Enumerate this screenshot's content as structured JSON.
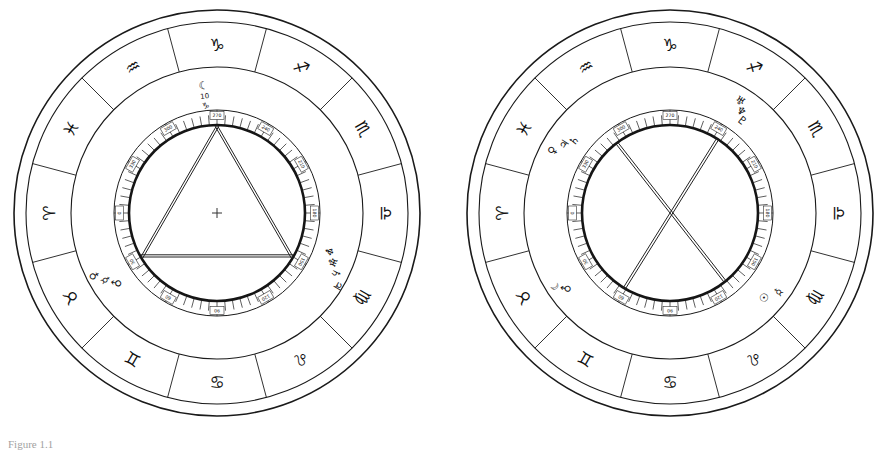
{
  "figure": {
    "caption_label": "Figure",
    "caption_text": "Figure 1.1",
    "background": "#ffffff",
    "ink": "#1a1a1a"
  },
  "zodiac": {
    "order_ccw_from_top": [
      {
        "name": "Capricorn",
        "glyph": "♑",
        "abbr": "Cp"
      },
      {
        "name": "Aquarius",
        "glyph": "♒",
        "abbr": "Aq"
      },
      {
        "name": "Pisces",
        "glyph": "♓",
        "abbr": "Pi"
      },
      {
        "name": "Aries",
        "glyph": "♈",
        "abbr": "Ar"
      },
      {
        "name": "Taurus",
        "glyph": "♉",
        "abbr": "Ta"
      },
      {
        "name": "Gemini",
        "glyph": "♊",
        "abbr": "Ge"
      },
      {
        "name": "Cancer",
        "glyph": "♋",
        "abbr": "Cn"
      },
      {
        "name": "Leo",
        "glyph": "♌",
        "abbr": "Le"
      },
      {
        "name": "Virgo",
        "glyph": "♍",
        "abbr": "Vi"
      },
      {
        "name": "Libra",
        "glyph": "♎",
        "abbr": "Li"
      },
      {
        "name": "Scorpio",
        "glyph": "♏",
        "abbr": "Sc"
      },
      {
        "name": "Sagittarius",
        "glyph": "♐",
        "abbr": "Sg"
      }
    ]
  },
  "chart_data": {
    "type": "diagram",
    "wheels": [
      {
        "id": "left-wheel",
        "label": "Left chart — grand trine",
        "center": {
          "x": 217,
          "y": 213
        },
        "radii": {
          "outer": 203,
          "outer_inner": 191,
          "zodiac_inner": 146,
          "house_outer": 103,
          "house_inner": 88
        },
        "aspect_figure": "triangle",
        "aspect_points_deg": [
          90,
          210,
          330
        ],
        "aspect_name": "grand trine",
        "house_numbers": [
          "270",
          "300",
          "330",
          "0",
          "30",
          "60",
          "90",
          "120",
          "150",
          "180",
          "210",
          "240"
        ],
        "planets": [
          {
            "glyph": "☾",
            "name": "Moon",
            "deg_label": "10",
            "sign_glyph": "♑",
            "angle": 96,
            "radius": 128
          },
          {
            "glyph": "♆",
            "name": "Neptune",
            "angle": 341,
            "radius": 118
          },
          {
            "glyph": "♅",
            "name": "Uranus",
            "angle": 337,
            "radius": 125
          },
          {
            "glyph": "♄",
            "name": "Saturn",
            "angle": 333,
            "radius": 133
          },
          {
            "glyph": "♃",
            "name": "Jupiter",
            "angle": 329,
            "radius": 141
          },
          {
            "glyph": "♂",
            "name": "Mars",
            "angle": 215,
            "radius": 122
          },
          {
            "glyph": "☿",
            "name": "Mercury",
            "angle": 211,
            "radius": 130
          },
          {
            "glyph": "♀",
            "name": "Venus",
            "angle": 207,
            "radius": 138
          }
        ]
      },
      {
        "id": "right-wheel",
        "label": "Right chart — oppositions",
        "center": {
          "x": 670,
          "y": 213
        },
        "radii": {
          "outer": 203,
          "outer_inner": 191,
          "zodiac_inner": 146,
          "house_outer": 103,
          "house_inner": 88
        },
        "aspect_figure": "cross",
        "aspect_points_deg": [
          58,
          128,
          238,
          308
        ],
        "aspect_name": "double opposition",
        "house_numbers": [
          "270",
          "300",
          "330",
          "0",
          "30",
          "60",
          "90",
          "120",
          "150",
          "180",
          "210",
          "240"
        ],
        "planets": [
          {
            "glyph": "♀",
            "name": "Venus",
            "angle": 152,
            "radius": 133
          },
          {
            "glyph": "♃",
            "name": "Jupiter",
            "angle": 147,
            "radius": 126
          },
          {
            "glyph": "♄",
            "name": "Saturn",
            "angle": 143,
            "radius": 120
          },
          {
            "glyph": "♅",
            "name": "Uranus",
            "angle": 58,
            "radius": 132
          },
          {
            "glyph": "♆",
            "name": "Neptune",
            "angle": 55,
            "radius": 124
          },
          {
            "glyph": "♇",
            "name": "Pluto",
            "angle": 52,
            "radius": 117
          },
          {
            "glyph": "☉",
            "name": "Sun",
            "angle": 318,
            "radius": 126
          },
          {
            "glyph": "☿",
            "name": "Mercury",
            "angle": 324,
            "radius": 134
          },
          {
            "glyph": "♂",
            "name": "Mars",
            "angle": 216,
            "radius": 128
          },
          {
            "glyph": "☾",
            "name": "Moon",
            "angle": 212,
            "radius": 136
          }
        ]
      }
    ]
  }
}
